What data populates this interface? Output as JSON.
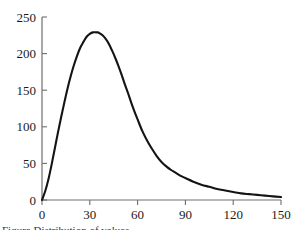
{
  "figure": {
    "caption": "Figure  Distribution of values",
    "background_color": "#ffffff",
    "curve_color": "#141414",
    "axis_color": "#6e6e6e"
  },
  "chart_data": {
    "type": "line",
    "title": "",
    "subtitle": "",
    "xlabel": "",
    "ylabel": "",
    "xlim": [
      0,
      150
    ],
    "ylim": [
      0,
      250
    ],
    "xticks": [
      0,
      30,
      60,
      90,
      120,
      150
    ],
    "yticks": [
      0,
      50,
      100,
      150,
      200,
      250
    ],
    "xticklabels": [
      "0",
      "30",
      "60",
      "90",
      "120",
      "150"
    ],
    "yticklabels": [
      "0",
      "50",
      "100",
      "150",
      "200",
      "250"
    ],
    "grid": false,
    "legend": null,
    "annotations": [],
    "peak": {
      "x": 35,
      "y": 229
    },
    "series": [
      {
        "name": "curve",
        "color": "#141414",
        "x": [
          0,
          2,
          4,
          6,
          8,
          10,
          12,
          14,
          16,
          18,
          20,
          22,
          24,
          26,
          28,
          30,
          32,
          34,
          35,
          36,
          38,
          40,
          42,
          44,
          46,
          48,
          50,
          52,
          54,
          56,
          58,
          60,
          63,
          66,
          69,
          72,
          75,
          78,
          81,
          84,
          87,
          90,
          95,
          100,
          105,
          110,
          115,
          120,
          125,
          130,
          135,
          140,
          145,
          150
        ],
        "y": [
          0,
          12,
          28,
          48,
          70,
          92,
          113,
          133,
          152,
          169,
          184,
          197,
          208,
          216,
          223,
          227,
          229,
          229,
          229,
          228,
          225,
          220,
          213,
          204,
          194,
          183,
          171,
          158,
          146,
          133,
          121,
          110,
          94,
          81,
          70,
          60,
          52,
          46,
          41,
          37,
          33,
          30,
          25,
          21,
          18,
          15,
          13,
          11,
          9,
          8,
          7,
          6,
          5,
          4
        ]
      }
    ]
  }
}
